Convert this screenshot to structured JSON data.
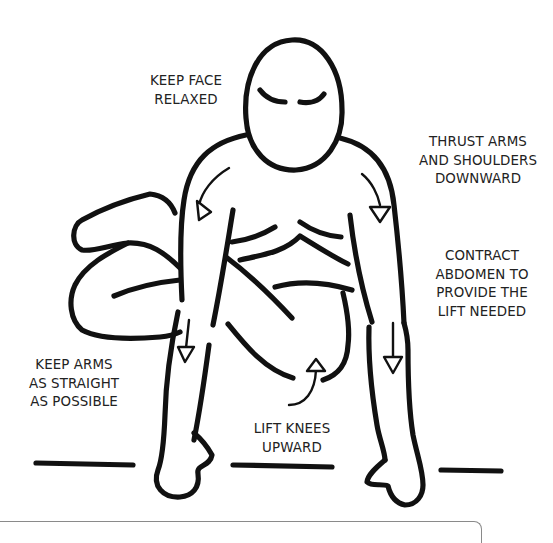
{
  "illustration": {
    "subject": "crouching figure with arms straight, knees lifted",
    "ink_color": "#111111",
    "background_color": "#ffffff"
  },
  "labels": {
    "face": {
      "lines": [
        "KEEP FACE",
        "RELAXED"
      ]
    },
    "shoulders": {
      "lines": [
        "THRUST ARMS",
        "AND SHOULDERS",
        "DOWNWARD"
      ]
    },
    "abdomen": {
      "lines": [
        "CONTRACT",
        "ABDOMEN TO",
        "PROVIDE THE",
        "LIFT NEEDED"
      ]
    },
    "arms": {
      "lines": [
        "KEEP ARMS",
        "AS STRAIGHT",
        "AS POSSIBLE"
      ]
    },
    "knees": {
      "lines": [
        "LIFT KNEES",
        "UPWARD"
      ]
    }
  },
  "arrows": [
    {
      "name": "left-shoulder-arrow",
      "direction": "down"
    },
    {
      "name": "right-shoulder-arrow",
      "direction": "down"
    },
    {
      "name": "left-forearm-arrow",
      "direction": "down"
    },
    {
      "name": "right-forearm-arrow",
      "direction": "down"
    },
    {
      "name": "knee-arrow",
      "direction": "up"
    }
  ]
}
